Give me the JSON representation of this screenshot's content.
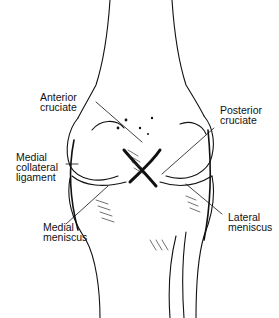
{
  "diagram": {
    "labels": {
      "anterior_cruciate": [
        "Anterior",
        "cruciate"
      ],
      "posterior_cruciate": [
        "Posterior",
        "cruciate"
      ],
      "medial_collateral": [
        "Medial",
        "collateral",
        "ligament"
      ],
      "medial_meniscus": [
        "Medial",
        "meniscus"
      ],
      "lateral_meniscus": [
        "Lateral",
        "meniscus"
      ]
    }
  }
}
